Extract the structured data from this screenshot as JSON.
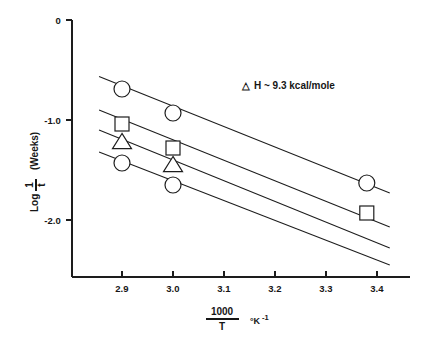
{
  "chart_data": {
    "type": "scatter",
    "title": "",
    "subtitle": "",
    "xlabel_numerator": "1000",
    "xlabel_denominator": "T",
    "xlabel_units": "°K",
    "xlabel_units_exp": "-1",
    "ylabel_prefix": "Log",
    "ylabel_numerator": "1",
    "ylabel_denominator": "t",
    "ylabel_units": "(Weeks)",
    "xlim": [
      2.83,
      3.43
    ],
    "ylim": [
      -2.45,
      0.0
    ],
    "grid": false,
    "legend": "none",
    "xticks": [
      2.9,
      3.0,
      3.1,
      3.2,
      3.3,
      3.4
    ],
    "xtick_labels": [
      "2.9",
      "3.0",
      "3.1",
      "3.2",
      "3.3",
      "3.4"
    ],
    "yticks": [
      0.0,
      -1.0,
      -2.0
    ],
    "ytick_labels": [
      "0",
      "-1.0",
      "-2.0"
    ],
    "annotations": [
      {
        "name": "enthalpy-annotation",
        "symbol": "△",
        "text": "H  ~  9.3 kcal/mole",
        "x": 3.12,
        "y": -0.52
      }
    ],
    "series": [
      {
        "name": "Series 1",
        "marker": "circle",
        "points": [
          {
            "x": 2.9,
            "y": -0.69
          },
          {
            "x": 3.0,
            "y": -0.93
          },
          {
            "x": 3.38,
            "y": -1.63
          }
        ],
        "fit_line": {
          "x_start": 2.855,
          "y_start": -0.565,
          "x_end": 3.425,
          "y_end": -1.73
        }
      },
      {
        "name": "Series 2",
        "marker": "square",
        "points": [
          {
            "x": 2.9,
            "y": -1.04
          },
          {
            "x": 3.0,
            "y": -1.28
          },
          {
            "x": 3.38,
            "y": -1.93
          }
        ],
        "fit_line": {
          "x_start": 2.855,
          "y_start": -0.9,
          "x_end": 3.425,
          "y_end": -2.07
        }
      },
      {
        "name": "Series 3",
        "marker": "triangle",
        "points": [
          {
            "x": 2.9,
            "y": -1.22
          },
          {
            "x": 3.0,
            "y": -1.45
          }
        ],
        "fit_line": {
          "x_start": 2.855,
          "y_start": -1.1,
          "x_end": 3.425,
          "y_end": -2.28
        }
      },
      {
        "name": "Series 4",
        "marker": "circle",
        "points": [
          {
            "x": 2.9,
            "y": -1.43
          },
          {
            "x": 3.0,
            "y": -1.65
          }
        ],
        "fit_line": {
          "x_start": 2.855,
          "y_start": -1.32,
          "x_end": 3.425,
          "y_end": -2.45
        }
      }
    ]
  },
  "colors": {
    "ink": "#1d1d1d",
    "background": "#ffffff",
    "marker_fill": "#ffffff"
  }
}
